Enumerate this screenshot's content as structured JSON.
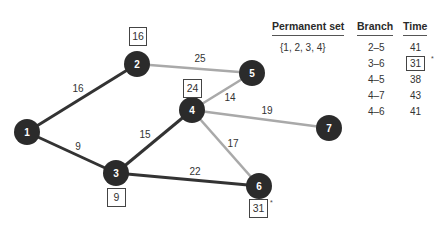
{
  "graph": {
    "nodes": [
      {
        "id": "1",
        "x": 27,
        "y": 132
      },
      {
        "id": "2",
        "x": 137,
        "y": 64
      },
      {
        "id": "3",
        "x": 116,
        "y": 173
      },
      {
        "id": "4",
        "x": 192,
        "y": 110
      },
      {
        "id": "5",
        "x": 252,
        "y": 73
      },
      {
        "id": "6",
        "x": 259,
        "y": 186
      },
      {
        "id": "7",
        "x": 329,
        "y": 128
      }
    ],
    "edges": [
      {
        "from": "1",
        "to": "2",
        "weight": "16",
        "style": "dark",
        "lx": 78,
        "ly": 92
      },
      {
        "from": "1",
        "to": "3",
        "weight": "9",
        "style": "dark",
        "lx": 78,
        "ly": 150
      },
      {
        "from": "3",
        "to": "4",
        "weight": "15",
        "style": "dark",
        "lx": 145,
        "ly": 138
      },
      {
        "from": "3",
        "to": "6",
        "weight": "22",
        "style": "dark",
        "lx": 195,
        "ly": 175
      },
      {
        "from": "2",
        "to": "5",
        "weight": "25",
        "style": "light",
        "lx": 200,
        "ly": 62
      },
      {
        "from": "4",
        "to": "5",
        "weight": "14",
        "style": "light",
        "lx": 230,
        "ly": 101
      },
      {
        "from": "4",
        "to": "7",
        "weight": "19",
        "style": "light",
        "lx": 267,
        "ly": 114
      },
      {
        "from": "4",
        "to": "6",
        "weight": "17",
        "style": "light",
        "lx": 233,
        "ly": 147
      }
    ],
    "node_labels": [
      {
        "node": "2",
        "value": "16",
        "x": 129,
        "y": 27,
        "w": 17,
        "h": 18,
        "star": false
      },
      {
        "node": "4",
        "value": "24",
        "x": 183,
        "y": 79,
        "w": 18,
        "h": 18,
        "star": false
      },
      {
        "node": "3",
        "value": "9",
        "x": 107,
        "y": 188,
        "w": 18,
        "h": 18,
        "star": false
      },
      {
        "node": "6",
        "value": "31",
        "x": 249,
        "y": 199,
        "w": 18,
        "h": 18,
        "star": true
      }
    ],
    "colors": {
      "node": "#2b2b2b",
      "node_text": "#ffffff",
      "dark_edge": "#333333",
      "light_edge": "#a9a9a9",
      "label_text": "#333333"
    }
  },
  "table": {
    "headers": {
      "permanent_set": "Permanent set",
      "branch": "Branch",
      "time": "Time"
    },
    "permanent_set": "{1, 2, 3, 4}",
    "rows": [
      {
        "branch": "2–5",
        "time": "41",
        "selected": false
      },
      {
        "branch": "3–6",
        "time": "31",
        "selected": true,
        "mark": "*"
      },
      {
        "branch": "4–5",
        "time": "38",
        "selected": false
      },
      {
        "branch": "4–7",
        "time": "43",
        "selected": false
      },
      {
        "branch": "4–6",
        "time": "41",
        "selected": false
      }
    ]
  }
}
